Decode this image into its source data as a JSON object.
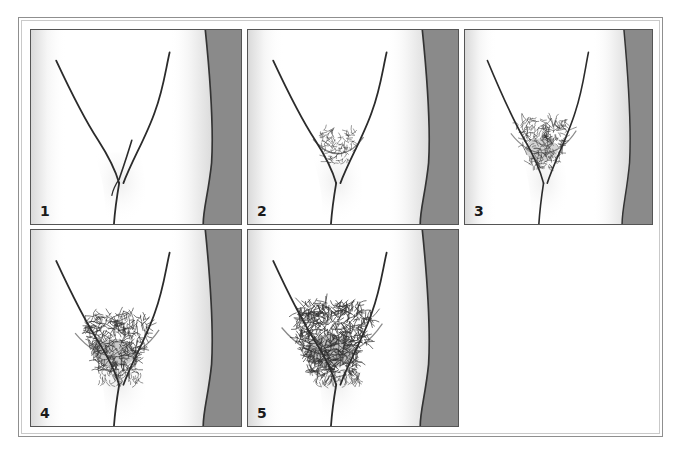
{
  "figure": {
    "type": "medical-illustration-series",
    "panel_count": 5,
    "layout": {
      "rows": 2,
      "columns": 3,
      "row_1_panels": [
        "1",
        "2",
        "3"
      ],
      "row_2_panels": [
        "4",
        "5"
      ],
      "empty_cells": 1
    },
    "colors": {
      "page_background": "#ffffff",
      "outer_frame_border": "#8f8f8f",
      "outer_frame_inner_border": "#c9c9c9",
      "panel_border": "#555555",
      "panel_background": "#ffffff",
      "gray_band": "#8a8a8a",
      "gray_band_edge_line": "#333333",
      "outline_stroke": "#2b2b2b",
      "hair_stroke": "#2f2f2f",
      "shadow_tint": "#d8d8d8",
      "number_color": "#1a1a1a"
    }
  },
  "panels": [
    {
      "id": "panel-1",
      "number": "1",
      "stage_label": "1",
      "hair_density": 0,
      "hair_description": "no pubic hair; bare pubic region with groin crease lines only",
      "has_gray_band": true,
      "geom": {
        "left": 11,
        "top": 11,
        "width": 212,
        "height": 196
      }
    },
    {
      "id": "panel-2",
      "number": "2",
      "stage_label": "2",
      "hair_density": 1,
      "hair_description": "sparse, lightly pigmented hair confined to a small central patch",
      "has_gray_band": true,
      "geom": {
        "left": 228,
        "top": 11,
        "width": 212,
        "height": 196
      }
    },
    {
      "id": "panel-3",
      "number": "3",
      "stage_label": "3",
      "hair_density": 2,
      "hair_description": "darker, coarser, curlier hair spreading sparsely over the pubic junction",
      "has_gray_band": true,
      "geom": {
        "left": 445,
        "top": 11,
        "width": 189,
        "height": 196
      }
    },
    {
      "id": "panel-4",
      "number": "4",
      "stage_label": "4",
      "hair_density": 3,
      "hair_description": "adult-type hair covering a smaller area, no spread to medial thigh",
      "has_gray_band": true,
      "geom": {
        "left": 11,
        "top": 211,
        "width": 212,
        "height": 198
      }
    },
    {
      "id": "panel-5",
      "number": "5",
      "stage_label": "5",
      "hair_density": 4,
      "hair_description": "adult quantity and type, horizontal upper border, spread to medial thigh",
      "has_gray_band": true,
      "geom": {
        "left": 228,
        "top": 211,
        "width": 212,
        "height": 198
      }
    }
  ]
}
